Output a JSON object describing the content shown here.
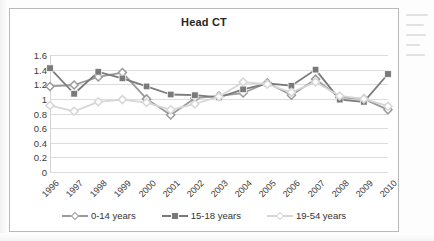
{
  "chart_data": {
    "type": "line",
    "title": "Head CT",
    "xlabel": "",
    "ylabel": "",
    "ylim": [
      0,
      1.6
    ],
    "ytick_step": 0.2,
    "yticks": [
      "1.6",
      "1.4",
      "1.2",
      "1",
      "0.8",
      "0.6",
      "0.4",
      "0.2",
      "0"
    ],
    "grid": true,
    "legend_position": "bottom",
    "categories": [
      "1996",
      "1997",
      "1998",
      "1999",
      "2000",
      "2001",
      "2002",
      "2003",
      "2004",
      "2005",
      "2006",
      "2007",
      "2008",
      "2009",
      "2010"
    ],
    "series": [
      {
        "name": "0-14 years",
        "color": "#9a9a9a",
        "marker": "diamond",
        "values": [
          1.17,
          1.19,
          1.3,
          1.36,
          1.0,
          0.78,
          1.01,
          1.04,
          1.08,
          1.22,
          1.05,
          1.27,
          1.02,
          1.0,
          0.85
        ]
      },
      {
        "name": "15-18 years",
        "color": "#7a7a7a",
        "marker": "square",
        "values": [
          1.42,
          1.07,
          1.37,
          1.28,
          1.17,
          1.06,
          1.05,
          1.02,
          1.13,
          1.21,
          1.18,
          1.4,
          0.99,
          0.96,
          1.34
        ]
      },
      {
        "name": "19-54 years",
        "color": "#d6d6d6",
        "marker": "diamond",
        "values": [
          0.91,
          0.83,
          0.96,
          0.99,
          0.95,
          0.85,
          0.93,
          1.03,
          1.23,
          1.2,
          1.09,
          1.23,
          1.04,
          1.0,
          0.9
        ]
      }
    ]
  },
  "legend": {
    "items": [
      {
        "label": "0-14 years"
      },
      {
        "label": "15-18 years"
      },
      {
        "label": "19-54 years"
      }
    ]
  }
}
